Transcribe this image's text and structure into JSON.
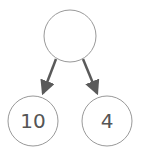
{
  "diagram": {
    "type": "binary-tree",
    "colors": {
      "node_stroke": "#999999",
      "edge": "#5a5a5a",
      "text": "#555555",
      "background": "#ffffff"
    },
    "nodes": [
      {
        "id": "root",
        "label": "",
        "cx": 70,
        "cy": 36,
        "r": 26
      },
      {
        "id": "left",
        "label": "10",
        "cx": 33,
        "cy": 121,
        "r": 25
      },
      {
        "id": "right",
        "label": "4",
        "cx": 107,
        "cy": 121,
        "r": 25
      }
    ],
    "edges": [
      {
        "from": "root",
        "to": "left"
      },
      {
        "from": "root",
        "to": "right"
      }
    ]
  }
}
